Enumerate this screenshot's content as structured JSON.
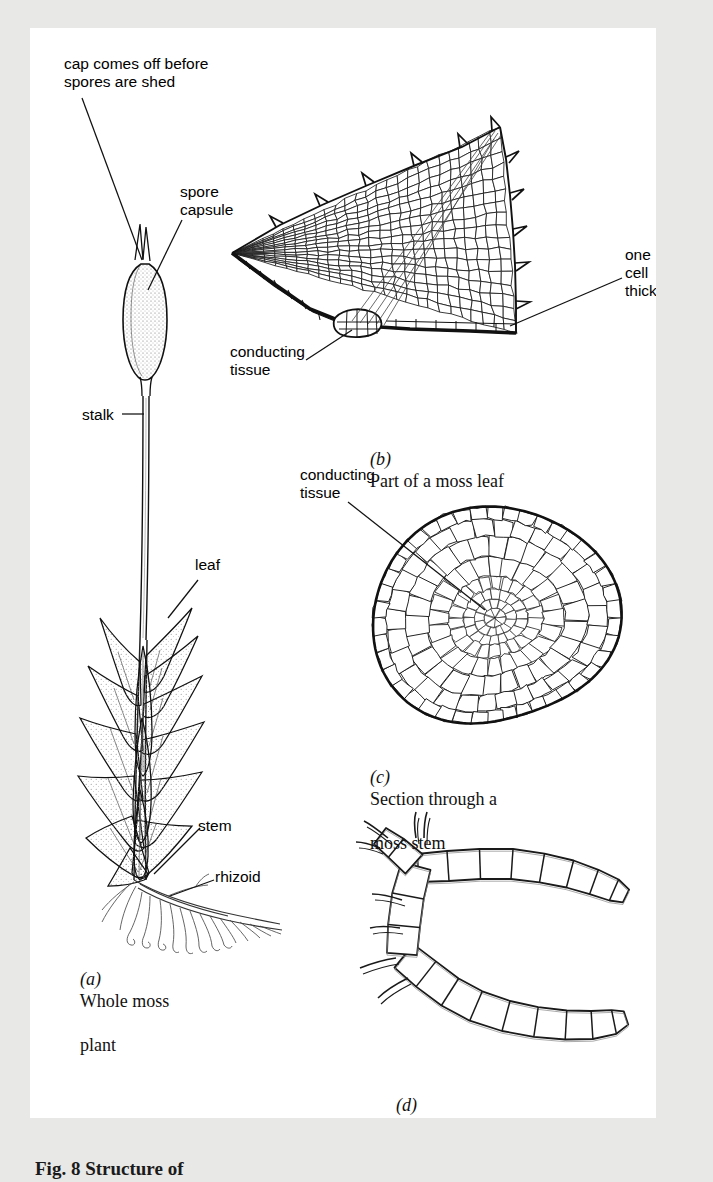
{
  "figure": {
    "caption": "Fig. 8  Structure of",
    "background_color": "#e8e8e6",
    "page_color": "#ffffff",
    "ink_color": "#000000"
  },
  "panels": [
    {
      "id": "a",
      "marker": "(a)",
      "caption_line1": "Whole moss",
      "caption_line2": "plant"
    },
    {
      "id": "b",
      "marker": "(b)",
      "caption_line1": "Part of a moss leaf",
      "caption_line2": ""
    },
    {
      "id": "c",
      "marker": "(c)",
      "caption_line1": "Section through a",
      "caption_line2": "moss stem"
    },
    {
      "id": "d",
      "marker": "(d)",
      "caption_line1": "Rhizoids",
      "caption_line2": ""
    }
  ],
  "labels": {
    "cap_off": "cap comes off before\nspores are shed",
    "spore_capsule": "spore\ncapsule",
    "stalk": "stalk",
    "leaf": "leaf",
    "stem": "stem",
    "rhizoid": "rhizoid",
    "conducting_tissue_leaf": "conducting\ntissue",
    "conducting_tissue_stem": "conducting\ntissue",
    "one_cell_thick": "one\ncell\nthick"
  },
  "diagram_data": {
    "type": "scientific-illustration",
    "subject": "moss plant structure",
    "parts": [
      "spore capsule",
      "cap",
      "stalk",
      "leaf",
      "stem",
      "rhizoid",
      "conducting tissue"
    ],
    "panel_a": {
      "description": "whole moss plant: leafy shoot with spiral lance-shaped leaves, long thin stalk bearing an ovoid spore capsule with pointed cap, rhizoids at base",
      "leaf_count": 16,
      "rhizoid_count": 22
    },
    "panel_b": {
      "description": "part of a moss leaf, triangular serrated blade of polygonal cells, one cell thick, thick basal conducting strand",
      "tooth_count": 11
    },
    "panel_c": {
      "description": "transverse section through a moss stem, rounded outline, small epidermal cells, larger cortical cells, fine central conducting strand",
      "ring_count": 7
    },
    "panel_d": {
      "description": "two branching rhizoid filaments of elongated rectangular cells meeting in a Y junction",
      "filament_count": 2
    }
  }
}
